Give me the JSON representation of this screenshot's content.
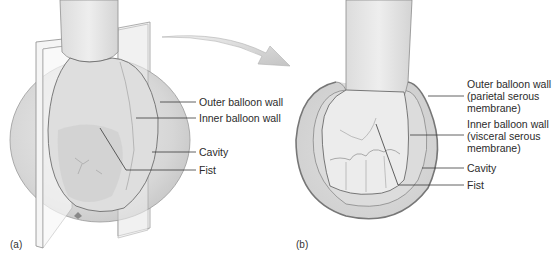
{
  "figure": {
    "panels": [
      {
        "id": "a",
        "tag": "(a)",
        "description": "Fist pushed into a balloon, shown with cut-away sectioning plane",
        "labels": [
          {
            "text": "Outer balloon wall"
          },
          {
            "text": "Inner balloon wall"
          },
          {
            "text": "Cavity"
          },
          {
            "text": "Fist"
          }
        ]
      },
      {
        "id": "b",
        "tag": "(b)",
        "description": "Cross-section view of fist enclosed by the two balloon walls",
        "labels": [
          {
            "text": "Outer balloon wall\n(parietal serous\nmembrane)"
          },
          {
            "text": "Inner balloon wall\n(visceral serous\nmembrane)"
          },
          {
            "text": "Cavity"
          },
          {
            "text": "Fist"
          }
        ]
      }
    ],
    "arrow": {
      "direction": "from panel a to panel b"
    },
    "colors": {
      "balloon_fill": "#d4d4d4",
      "balloon_light": "#e6e6e6",
      "balloon_outline": "#7a7a7a",
      "skin_fill": "#e9e9e9",
      "plane_fill": "#f2f2f2",
      "leader_line": "#3a3a3a",
      "arrow_fill": "#d0d0d0"
    }
  }
}
